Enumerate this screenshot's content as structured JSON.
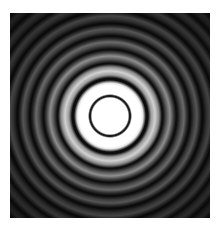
{
  "figure": {
    "type": "concentric interference ring pattern",
    "colors": {
      "background": "#ffffff",
      "center": "#ffffff",
      "dark_ring": "#0c0c0c",
      "outer_field": "#0a0a0a"
    },
    "rings": {
      "center_disk_radius_px": 19,
      "dark_ring_radii_px": [
        20,
        37,
        52,
        66,
        80,
        92,
        105,
        118,
        130,
        142
      ],
      "brightest_band": "between first and second dark ring"
    }
  }
}
